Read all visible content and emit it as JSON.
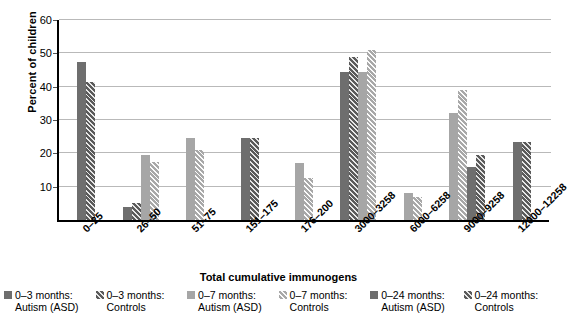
{
  "chart_data": {
    "type": "bar",
    "title": "",
    "xlabel": "Total cumulative immunogens",
    "ylabel": "Percent of children",
    "ylim": [
      0,
      60
    ],
    "yticks": [
      10,
      20,
      30,
      40,
      50,
      60
    ],
    "grid": true,
    "legend_position": "bottom",
    "categories": [
      "0–25",
      "26–50",
      "51–75",
      "151–175",
      "176–200",
      "3000–3258",
      "6000–6258",
      "9000–9258",
      "12000–12258"
    ],
    "series": [
      {
        "name": "0–3 months: Autism (ASD)",
        "style": "dark-solid",
        "color": "#6e6e6e",
        "values": [
          47.5,
          4.0,
          null,
          null,
          null,
          44.5,
          null,
          null,
          23.5
        ]
      },
      {
        "name": "0–3 months: Controls",
        "style": "dark-hatch",
        "color": "#5a5a5a",
        "values": [
          41.5,
          5.0,
          null,
          24.5,
          null,
          49.0,
          null,
          null,
          23.5
        ]
      },
      {
        "name": "0–7 months: Autism (ASD)",
        "style": "light-solid",
        "color": "#a6a6a6",
        "values": [
          null,
          19.5,
          24.5,
          null,
          17.0,
          44.5,
          8.0,
          32.0,
          null
        ]
      },
      {
        "name": "0–7 months: Controls",
        "style": "light-hatch",
        "color": "#a8a8a8",
        "values": [
          null,
          17.5,
          21.0,
          null,
          12.5,
          51.0,
          7.0,
          39.0,
          null
        ]
      },
      {
        "name": "0–24 months: Autism (ASD)",
        "style": "dark-solid",
        "color": "#6e6e6e",
        "values": [
          null,
          null,
          null,
          null,
          null,
          null,
          null,
          16.0,
          null
        ]
      },
      {
        "name": "0–24 months: Controls",
        "style": "dark-hatch",
        "color": "#5a5a5a",
        "values": [
          null,
          null,
          null,
          null,
          null,
          null,
          null,
          19.5,
          null
        ]
      }
    ],
    "groups": [
      {
        "category": "0–25",
        "bars": [
          {
            "style": "dark-solid",
            "value": 47.5
          },
          {
            "style": "dark-hatch",
            "value": 41.5
          }
        ]
      },
      {
        "category": "26–50",
        "bars": [
          {
            "style": "dark-solid",
            "value": 4.0
          },
          {
            "style": "dark-hatch",
            "value": 5.0
          },
          {
            "style": "light-solid",
            "value": 19.5
          },
          {
            "style": "light-hatch",
            "value": 17.5
          }
        ]
      },
      {
        "category": "51–75",
        "bars": [
          {
            "style": "light-solid",
            "value": 24.5
          },
          {
            "style": "light-hatch",
            "value": 21.0
          }
        ]
      },
      {
        "category": "151–175",
        "bars": [
          {
            "style": "dark-solid",
            "value": 24.5
          },
          {
            "style": "dark-hatch",
            "value": 24.5
          }
        ]
      },
      {
        "category": "176–200",
        "bars": [
          {
            "style": "light-solid",
            "value": 17.0
          },
          {
            "style": "light-hatch",
            "value": 12.5
          }
        ]
      },
      {
        "category": "3000–3258",
        "bars": [
          {
            "style": "dark-solid",
            "value": 44.5
          },
          {
            "style": "dark-hatch",
            "value": 49.0
          },
          {
            "style": "light-solid",
            "value": 44.5
          },
          {
            "style": "light-hatch",
            "value": 51.0
          }
        ]
      },
      {
        "category": "6000–6258",
        "bars": [
          {
            "style": "light-solid",
            "value": 8.0
          },
          {
            "style": "light-hatch",
            "value": 7.0
          }
        ]
      },
      {
        "category": "9000–9258",
        "bars": [
          {
            "style": "light-solid",
            "value": 32.0
          },
          {
            "style": "light-hatch",
            "value": 39.0
          },
          {
            "style": "dark-solid",
            "value": 16.0
          },
          {
            "style": "dark-hatch",
            "value": 19.5
          }
        ]
      },
      {
        "category": "12000–12258",
        "bars": [
          {
            "style": "dark-solid",
            "value": 23.5
          },
          {
            "style": "dark-hatch",
            "value": 23.5
          }
        ]
      }
    ],
    "legend": [
      {
        "line1": "0–3 months:",
        "line2": "Autism (ASD)",
        "style": "dark-solid"
      },
      {
        "line1": "0–3 months:",
        "line2": "Controls",
        "style": "dark-hatch"
      },
      {
        "line1": "0–7 months:",
        "line2": "Autism (ASD)",
        "style": "light-solid"
      },
      {
        "line1": "0–7 months:",
        "line2": "Controls",
        "style": "light-hatch"
      },
      {
        "line1": "0–24 months:",
        "line2": "Autism (ASD)",
        "style": "dark-solid"
      },
      {
        "line1": "0–24 months:",
        "line2": "Controls",
        "style": "dark-hatch"
      }
    ]
  }
}
